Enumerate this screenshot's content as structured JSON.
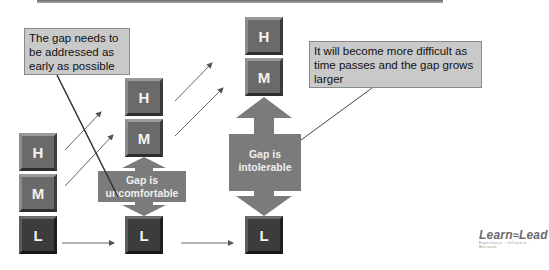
{
  "callouts": {
    "early": "The gap needs to be addressed as early as possible",
    "later": "It will become more difficult as time passes and the gap grows larger"
  },
  "columns": [
    {
      "keys": [
        {
          "label": "H"
        },
        {
          "label": "M"
        },
        {
          "label": "L"
        }
      ]
    },
    {
      "keys": [
        {
          "label": "H"
        },
        {
          "label": "M"
        },
        {
          "label": "L"
        }
      ]
    },
    {
      "keys": [
        {
          "label": "H"
        },
        {
          "label": "M"
        },
        {
          "label": "L"
        }
      ]
    }
  ],
  "gaps": {
    "middle": "Gap is uncomfortable",
    "right": "Gap is intolerable"
  },
  "logo": {
    "name_left": "Learn",
    "name_right": "Lead",
    "tagline": "Experience · Influence · Motivate"
  },
  "colors": {
    "key_mid": "#6a6a6a",
    "key_low": "#3c3c3c",
    "gap_arrow": "#7b7b7b",
    "callout_fill": "#c9c9c9"
  }
}
